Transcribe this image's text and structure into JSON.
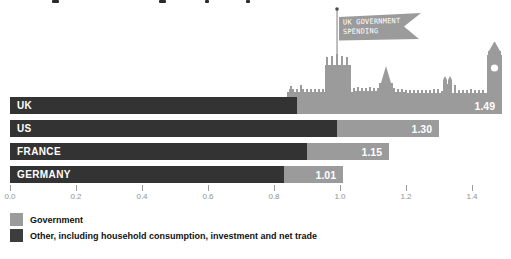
{
  "colors": {
    "government": "#9b9b9b",
    "other": "#333333",
    "legend_other": "#3d3d3d",
    "skyline": "#9b9b9b",
    "axis_text": "#929292",
    "value_text": "#ffffff",
    "flag_text": "#ffffff"
  },
  "chart_data": {
    "type": "bar",
    "orientation": "horizontal",
    "title": "",
    "categories": [
      "UK",
      "US",
      "FRANCE",
      "GERMANY"
    ],
    "series": [
      {
        "name": "Other, including household consumption, investment and net trade",
        "color": "#333333",
        "values": [
          0.87,
          0.99,
          0.9,
          0.83
        ]
      },
      {
        "name": "Government",
        "color": "#9b9b9b",
        "values": [
          0.62,
          0.31,
          0.25,
          0.18
        ]
      }
    ],
    "totals": [
      1.49,
      1.3,
      1.15,
      1.01
    ],
    "total_labels": [
      "1.49",
      "1.30",
      "1.15",
      "1.01"
    ],
    "x_ticks": [
      0.0,
      0.2,
      0.4,
      0.6,
      0.8,
      1.0,
      1.2,
      1.4
    ],
    "x_tick_labels": [
      "0.0",
      "0.2",
      "0.4",
      "0.6",
      "0.8",
      "1.0",
      "1.2",
      "1.4"
    ],
    "xlim": [
      0,
      1.52
    ],
    "grid": false,
    "legend_position": "bottom-left",
    "annotation": {
      "flag_line1": "UK GOVERNMENT",
      "flag_line2": "SPENDING",
      "illustration": "houses-of-parliament-and-big-ben-silhouette"
    }
  },
  "legend": [
    {
      "label": "Government",
      "color": "#9b9b9b"
    },
    {
      "label": "Other, including household consumption, investment and net trade",
      "color": "#3d3d3d"
    }
  ]
}
